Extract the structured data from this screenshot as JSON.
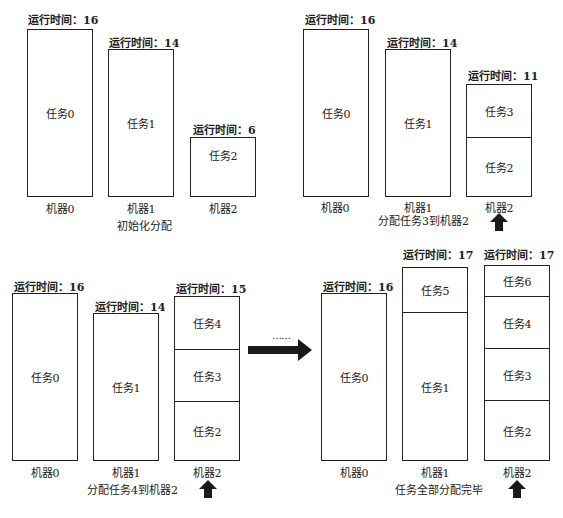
{
  "runtime_prefix": "运行时间：",
  "panels": [
    {
      "caption": "初始化分配",
      "machines": [
        {
          "label": "机器0",
          "runtime": "16",
          "tasks": [
            "任务0"
          ]
        },
        {
          "label": "机器1",
          "runtime": "14",
          "tasks": [
            "任务1"
          ]
        },
        {
          "label": "机器2",
          "runtime": "6",
          "tasks": [
            "任务2"
          ]
        }
      ]
    },
    {
      "caption": "分配任务3到机器2",
      "machines": [
        {
          "label": "机器0",
          "runtime": "16",
          "tasks": [
            "任务0"
          ]
        },
        {
          "label": "机器1",
          "runtime": "14",
          "tasks": [
            "任务1"
          ]
        },
        {
          "label": "机器2",
          "runtime": "11",
          "tasks": [
            "任务3",
            "任务2"
          ]
        }
      ],
      "highlight": "机器2"
    },
    {
      "caption": "分配任务4到机器2",
      "machines": [
        {
          "label": "机器0",
          "runtime": "16",
          "tasks": [
            "任务0"
          ]
        },
        {
          "label": "机器1",
          "runtime": "14",
          "tasks": [
            "任务1"
          ]
        },
        {
          "label": "机器2",
          "runtime": "15",
          "tasks": [
            "任务4",
            "任务3",
            "任务2"
          ]
        }
      ],
      "highlight": "机器2"
    },
    {
      "caption": "任务全部分配完毕",
      "machines": [
        {
          "label": "机器0",
          "runtime": "16",
          "tasks": [
            "任务0"
          ]
        },
        {
          "label": "机器1",
          "runtime": "17",
          "tasks": [
            "任务5",
            "任务1"
          ]
        },
        {
          "label": "机器2",
          "runtime": "17",
          "tasks": [
            "任务6",
            "任务4",
            "任务3",
            "任务2"
          ]
        }
      ],
      "highlight": "机器2"
    }
  ],
  "transition": {
    "ellipsis": "……"
  },
  "colors": {
    "stroke": "#222222",
    "arrow": "#1a1a1a",
    "background": "#ffffff"
  }
}
